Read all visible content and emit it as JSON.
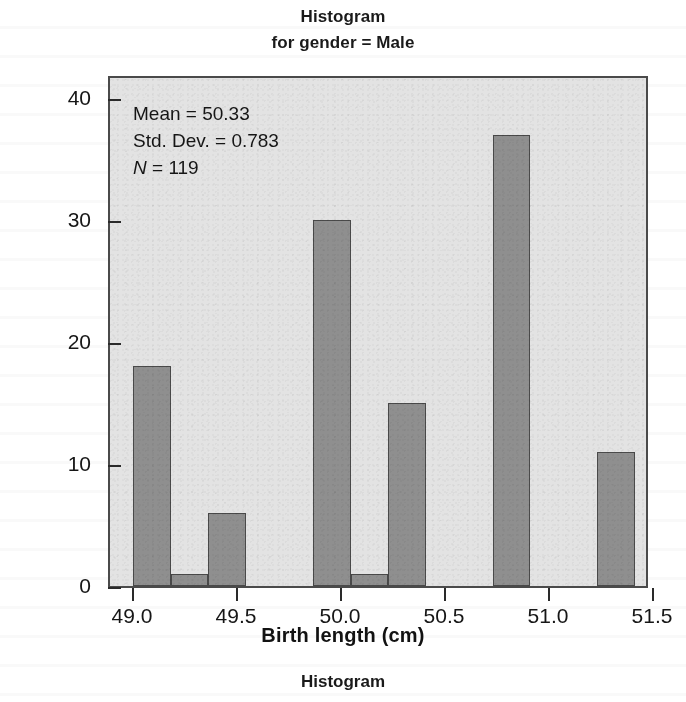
{
  "figure": {
    "title_lines": [
      "Histogram",
      "for gender = Male"
    ],
    "footer_title": "Histogram",
    "plot_background": "#e3e3e3",
    "bar_fill": "#8f8f8f",
    "bar_edge": "#4a4a4a"
  },
  "annotation": {
    "mean_label": "Mean = 50.33",
    "sd_label": "Std. Dev. = 0.783",
    "n_symbol": "N",
    "n_value": " = 119"
  },
  "chart_data": {
    "type": "bar",
    "title": "Histogram",
    "subtitle": "for gender = Male",
    "xlabel": "Birth length (cm)",
    "ylabel": "Frequency",
    "xlim": [
      48.85,
      51.45
    ],
    "ylim": [
      0,
      42
    ],
    "grid": false,
    "legend": "none",
    "xticks": [
      "49.0",
      "49.5",
      "50.0",
      "50.5",
      "51.0",
      "51.5"
    ],
    "xtick_values": [
      49.0,
      49.5,
      50.0,
      50.5,
      51.0,
      51.5
    ],
    "yticks": [
      "0",
      "10",
      "20",
      "30",
      "40"
    ],
    "ytick_values": [
      0,
      10,
      20,
      30,
      40
    ],
    "bin_width": 0.25,
    "bin_centers": [
      49.05,
      49.25,
      49.43,
      50.0,
      50.25,
      50.45,
      51.0,
      51.5
    ],
    "values": [
      18,
      1,
      6,
      30,
      1,
      15,
      37,
      11
    ],
    "statistics": {
      "mean": 50.33,
      "std_dev": 0.783,
      "n": 119
    }
  },
  "bars": [
    {
      "label": "bar-49.0",
      "value": 18,
      "left_pct": 4.3,
      "width_pct": 7.0
    },
    {
      "label": "bar-49.2",
      "value": 1,
      "left_pct": 11.3,
      "width_pct": 7.0
    },
    {
      "label": "bar-49.4",
      "value": 6,
      "left_pct": 18.3,
      "width_pct": 7.0
    },
    {
      "label": "bar-50.0",
      "value": 30,
      "left_pct": 37.9,
      "width_pct": 7.0
    },
    {
      "label": "bar-50.2",
      "value": 1,
      "left_pct": 44.9,
      "width_pct": 7.0
    },
    {
      "label": "bar-50.4",
      "value": 15,
      "left_pct": 51.9,
      "width_pct": 7.0
    },
    {
      "label": "bar-51.0",
      "value": 37,
      "left_pct": 71.4,
      "width_pct": 7.0
    },
    {
      "label": "bar-51.5",
      "value": 11,
      "left_pct": 90.9,
      "width_pct": 7.0
    }
  ],
  "axis_geometry": {
    "plot_left": 108,
    "plot_top": 76,
    "plot_width": 540,
    "plot_height": 512,
    "y_zero_px": 588,
    "px_per_unit_y": 12.2,
    "x_positions_px": [
      132,
      236,
      340,
      444,
      548,
      652
    ]
  }
}
